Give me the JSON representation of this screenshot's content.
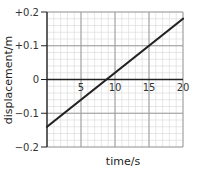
{
  "chart_data": {
    "type": "line",
    "title": "",
    "xlabel": "time/s",
    "ylabel": "displacement/m",
    "xlim": [
      0,
      20
    ],
    "ylim": [
      -0.2,
      0.2
    ],
    "x_ticks": [
      5,
      10,
      15,
      20
    ],
    "x_tick_labels": [
      "5",
      "10",
      "15",
      "20"
    ],
    "y_ticks": [
      0.2,
      0.1,
      0,
      -0.1,
      -0.2
    ],
    "y_tick_labels": [
      "+0.2",
      "+0.1",
      "0",
      "−0.1",
      "−0.2"
    ],
    "grid": true,
    "minor_grid": {
      "x_step": 1,
      "y_step": 0.02
    },
    "legend": null,
    "series": [
      {
        "name": "displacement",
        "x": [
          0,
          20
        ],
        "y": [
          -0.14,
          0.18
        ],
        "color": "#222222"
      }
    ]
  },
  "colors": {
    "major_grid": "#9a9a9a",
    "minor_grid": "#d6d6d6",
    "axis": "#222222",
    "line": "#222222"
  }
}
